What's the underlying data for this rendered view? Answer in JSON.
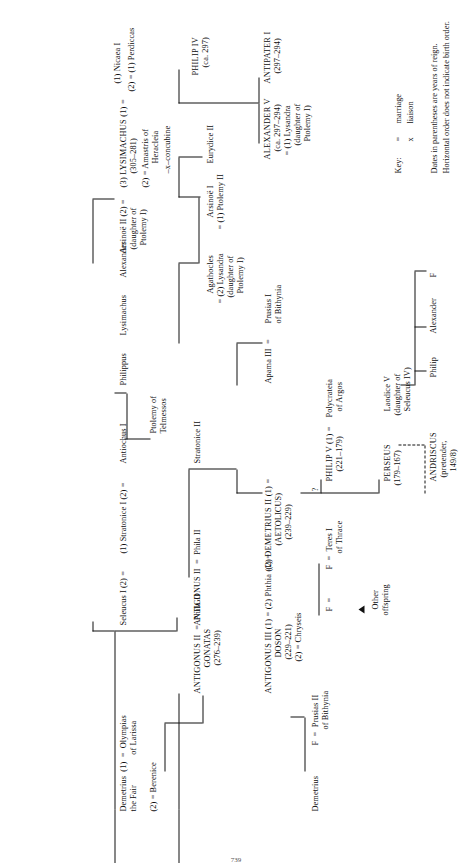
{
  "document": {
    "type": "genealogical-chart",
    "title": "Antigonid dynasty family tree",
    "orientation": "rotated-90-ccw",
    "page_number": "739"
  },
  "key": {
    "label": "Key:",
    "marriage_symbol": "=",
    "marriage_text": "marriage",
    "liaison_symbol": "x",
    "liaison_text": "liaison",
    "note_line_1": "Dates in parentheses are years of reign.",
    "note_line_2": "Horizontal order does not indicate birth order."
  },
  "nodes": {
    "philip_iv": {
      "name": "PHILIP IV",
      "dates": "(ca. 297)"
    },
    "alexander_v": {
      "name": "ALEXANDER V",
      "dates": "(ca. 297–294)",
      "spouse_1": "= (1) Lysandra",
      "spouse_1_note_a": "(daughter of",
      "spouse_1_note_b": "Ptolemy I)"
    },
    "antipater_i": {
      "name": "ANTIPATER I",
      "dates": "(297–294)"
    },
    "eurydice_ii": {
      "name": "Eurydice II",
      "link": "="
    },
    "arsinoe_i": {
      "name": "Arsinoë I",
      "spouse": "= (1) Ptolemy II"
    },
    "agathocles": {
      "name": "Agathocles",
      "spouse": "= (2) Lysandra",
      "note_a": "(daughter of",
      "note_b": "Ptolemy I)"
    },
    "lysimachus_head": {
      "ordinal": "(3) LYSIMACHUS (1) =",
      "dates": "(305–281)",
      "wife_2": "(2) = Amastris of",
      "wife_2_note": "Heracleia",
      "concubine": "–x–concubine"
    },
    "nicaea": {
      "line_1": "(1) Nicaea I",
      "line_2": "(2) = (1) Perdiccas"
    },
    "arsinoe_ii": {
      "name": "Arsinoë II (2) =",
      "note_a": "(daughter of",
      "note_b": "Ptolemy I)"
    },
    "antiochus_i": {
      "name": "Antiochus I"
    },
    "lysimachus_son": {
      "name": "Lysimachus"
    },
    "alexander_son": {
      "name": "Alexander"
    },
    "philippus": {
      "name": "Philippus"
    },
    "ptolemy_telmessos": {
      "line_1": "Ptolemy of",
      "line_2": "Telmessos"
    },
    "seleucus_i": {
      "name": "Seleucus I (2) ="
    },
    "stratonice_i": {
      "name": "(1) Stratonice I (2) ="
    },
    "stratonice_ii": {
      "name": "Stratonice II"
    },
    "apama_iii": {
      "name": "Apama III  ="
    },
    "prusias_i": {
      "line_1": "Prusias I",
      "line_2": "of Bithynia"
    },
    "demetrius_fair": {
      "line_1": "Demetrius  (1)  =  Olympias",
      "line_2": "the Fair              of Larissa",
      "line_3": "(2) = Berenice"
    },
    "antigonus_ii": {
      "name": "ANTIGONUS II  =  Phila II",
      "epithet": "GONATAS",
      "dates": "(276–239)"
    },
    "antigonus_iii": {
      "name": "ANTIGONUS III (1) = (2) Phthia (1) =",
      "epithet": "DOSON",
      "dates": "(229–221)",
      "spouse_2": "(2) = Chryseis"
    },
    "demetrius_ii": {
      "name": "(2) DEMETRIUS II (1) =",
      "epithet": "(AETOLICUS)",
      "dates": "(239–229)"
    },
    "philip_v": {
      "name": "PHILIP V (1) =",
      "dates": "(221–179)"
    },
    "polycrateia": {
      "line_1": "Polycrateia",
      "line_2": "of Argos"
    },
    "perseus": {
      "name": "PERSEUS",
      "dates": "(179–167)"
    },
    "laodice_v": {
      "name": "Laodice V",
      "note_a": "(daughter of",
      "note_b": "Seleucus IV)"
    },
    "andriscus": {
      "name": "ANDRISCUS",
      "note_a": "(pretender,",
      "note_b": "149/8)"
    },
    "teres": {
      "line_1": "F  =  Teres I",
      "line_2": "of Thrace"
    },
    "prusias_ii": {
      "line_1": "F  =  Prusias II",
      "line_2": "of Bithynia"
    },
    "demetrius_son": {
      "name": "Demetrius"
    },
    "philip_son": {
      "name": "Philip"
    },
    "alexander_son2": {
      "name": "Alexander"
    },
    "f_daughter": {
      "name": "F"
    },
    "f_marker": {
      "name": "F  ="
    },
    "other_offspring": {
      "line_1": "Other",
      "line_2": "offspring"
    },
    "uncertain": {
      "name": "?"
    }
  }
}
